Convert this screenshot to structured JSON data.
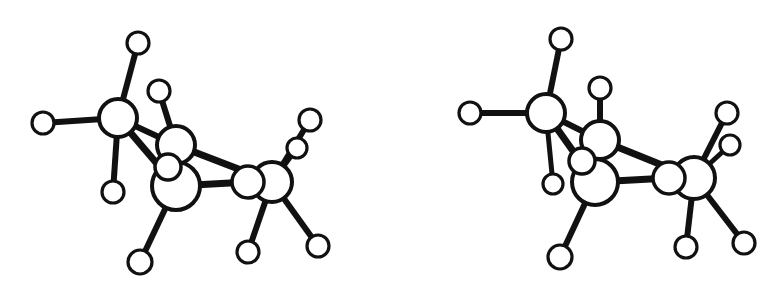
{
  "figure": {
    "background_color": "#ffffff",
    "line_color": "#111111",
    "atom_fill_color": "#ffffff",
    "width": 780,
    "height": 287
  },
  "chart_data": {
    "type": "diagram",
    "subtitle": "",
    "xlabel": "",
    "ylabel": "",
    "grid": false,
    "legend": "none",
    "panels": [
      {
        "name": "left-molecule",
        "label": "Left eye view",
        "atoms": [
          {
            "id": "L-C1",
            "kind": "carbon",
            "x": 118,
            "y": 118,
            "r": 19,
            "stroke": 4.0
          },
          {
            "id": "L-C2",
            "kind": "carbon",
            "x": 176,
            "y": 145,
            "r": 19,
            "stroke": 4.0
          },
          {
            "id": "L-C3",
            "kind": "carbon",
            "x": 176,
            "y": 186,
            "r": 24,
            "stroke": 4.0
          },
          {
            "id": "L-C4",
            "kind": "carbon",
            "x": 272,
            "y": 182,
            "r": 20,
            "stroke": 4.0
          },
          {
            "id": "L-C5",
            "kind": "carbon",
            "x": 248,
            "y": 182,
            "r": 16,
            "stroke": 3.5
          },
          {
            "id": "L-C6",
            "kind": "carbon",
            "x": 168,
            "y": 167,
            "r": 13,
            "stroke": 3.5
          },
          {
            "id": "L-H1",
            "kind": "hydrogen",
            "x": 138,
            "y": 43,
            "r": 11,
            "stroke": 3.2
          },
          {
            "id": "L-H2",
            "kind": "hydrogen",
            "x": 43,
            "y": 123,
            "r": 11,
            "stroke": 3.2
          },
          {
            "id": "L-H3",
            "kind": "hydrogen",
            "x": 159,
            "y": 91,
            "r": 11,
            "stroke": 3.2
          },
          {
            "id": "L-H4",
            "kind": "hydrogen",
            "x": 113,
            "y": 192,
            "r": 11,
            "stroke": 3.2
          },
          {
            "id": "L-H5",
            "kind": "hydrogen",
            "x": 140,
            "y": 262,
            "r": 12,
            "stroke": 3.2
          },
          {
            "id": "L-H6",
            "kind": "hydrogen",
            "x": 248,
            "y": 252,
            "r": 11,
            "stroke": 3.2
          },
          {
            "id": "L-H7",
            "kind": "hydrogen",
            "x": 318,
            "y": 246,
            "r": 11,
            "stroke": 3.2
          },
          {
            "id": "L-H8",
            "kind": "hydrogen",
            "x": 310,
            "y": 120,
            "r": 11,
            "stroke": 3.2
          },
          {
            "id": "L-H9",
            "kind": "hydrogen",
            "x": 297,
            "y": 148,
            "r": 10,
            "stroke": 3.2
          }
        ],
        "bonds": [
          {
            "from": "L-C1",
            "to": "L-H1",
            "width": 6
          },
          {
            "from": "L-C1",
            "to": "L-H2",
            "width": 6
          },
          {
            "from": "L-C1",
            "to": "L-C2",
            "width": 6
          },
          {
            "from": "L-C1",
            "to": "L-C3",
            "width": 7
          },
          {
            "from": "L-C1",
            "to": "L-H4",
            "width": 6
          },
          {
            "from": "L-C2",
            "to": "L-H3",
            "width": 6
          },
          {
            "from": "L-C2",
            "to": "L-C4",
            "width": 7
          },
          {
            "from": "L-C3",
            "to": "L-C5",
            "width": 7
          },
          {
            "from": "L-C3",
            "to": "L-H5",
            "width": 6
          },
          {
            "from": "L-C6",
            "to": "L-C3",
            "width": 5
          },
          {
            "from": "L-C4",
            "to": "L-H6",
            "width": 6
          },
          {
            "from": "L-C4",
            "to": "L-H7",
            "width": 6
          },
          {
            "from": "L-C4",
            "to": "L-H8",
            "width": 6
          },
          {
            "from": "L-C4",
            "to": "L-H9",
            "width": 5
          }
        ]
      },
      {
        "name": "right-molecule",
        "label": "Right eye view",
        "atoms": [
          {
            "id": "R-C1",
            "kind": "carbon",
            "x": 546,
            "y": 113,
            "r": 19,
            "stroke": 4.0
          },
          {
            "id": "R-C2",
            "kind": "carbon",
            "x": 600,
            "y": 140,
            "r": 19,
            "stroke": 4.0
          },
          {
            "id": "R-C3",
            "kind": "carbon",
            "x": 595,
            "y": 182,
            "r": 23,
            "stroke": 4.0
          },
          {
            "id": "R-C4",
            "kind": "carbon",
            "x": 694,
            "y": 178,
            "r": 21,
            "stroke": 4.0
          },
          {
            "id": "R-C5",
            "kind": "carbon",
            "x": 669,
            "y": 178,
            "r": 16,
            "stroke": 3.5
          },
          {
            "id": "R-C6",
            "kind": "carbon",
            "x": 582,
            "y": 161,
            "r": 13,
            "stroke": 3.5
          },
          {
            "id": "R-H1",
            "kind": "hydrogen",
            "x": 561,
            "y": 39,
            "r": 11,
            "stroke": 3.2
          },
          {
            "id": "R-H2",
            "kind": "hydrogen",
            "x": 470,
            "y": 113,
            "r": 11,
            "stroke": 3.2
          },
          {
            "id": "R-H3",
            "kind": "hydrogen",
            "x": 600,
            "y": 88,
            "r": 11,
            "stroke": 3.2
          },
          {
            "id": "R-H4",
            "kind": "hydrogen",
            "x": 553,
            "y": 184,
            "r": 10,
            "stroke": 3.2
          },
          {
            "id": "R-H5",
            "kind": "hydrogen",
            "x": 560,
            "y": 257,
            "r": 12,
            "stroke": 3.2
          },
          {
            "id": "R-H6",
            "kind": "hydrogen",
            "x": 686,
            "y": 247,
            "r": 11,
            "stroke": 3.2
          },
          {
            "id": "R-H7",
            "kind": "hydrogen",
            "x": 744,
            "y": 243,
            "r": 11,
            "stroke": 3.2
          },
          {
            "id": "R-H8",
            "kind": "hydrogen",
            "x": 727,
            "y": 113,
            "r": 11,
            "stroke": 3.2
          },
          {
            "id": "R-H9",
            "kind": "hydrogen",
            "x": 730,
            "y": 145,
            "r": 10,
            "stroke": 3.2
          }
        ],
        "bonds": [
          {
            "from": "R-C1",
            "to": "R-H1",
            "width": 6
          },
          {
            "from": "R-C1",
            "to": "R-H2",
            "width": 6
          },
          {
            "from": "R-C1",
            "to": "R-C2",
            "width": 6
          },
          {
            "from": "R-C1",
            "to": "R-C3",
            "width": 7
          },
          {
            "from": "R-C1",
            "to": "R-H4",
            "width": 5
          },
          {
            "from": "R-C2",
            "to": "R-H3",
            "width": 6
          },
          {
            "from": "R-C2",
            "to": "R-C4",
            "width": 7
          },
          {
            "from": "R-C3",
            "to": "R-C5",
            "width": 7
          },
          {
            "from": "R-C3",
            "to": "R-H5",
            "width": 6
          },
          {
            "from": "R-C6",
            "to": "R-C3",
            "width": 5
          },
          {
            "from": "R-C4",
            "to": "R-H6",
            "width": 6
          },
          {
            "from": "R-C4",
            "to": "R-H7",
            "width": 6
          },
          {
            "from": "R-C4",
            "to": "R-H8",
            "width": 6
          },
          {
            "from": "R-C4",
            "to": "R-H9",
            "width": 5
          }
        ]
      }
    ]
  }
}
